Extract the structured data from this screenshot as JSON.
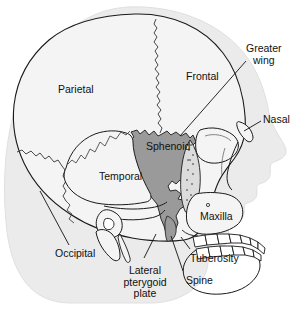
{
  "figure": {
    "width": 306,
    "height": 313
  },
  "colors": {
    "background": "#ffffff",
    "head_silhouette": "#ebebeb",
    "skull_fill": "#f4f4f4",
    "sphenoid_fill": "#9a9a9a",
    "outline": "#1a1a1a",
    "suture": "#333333",
    "leader_line": "#111111",
    "text": "#111111"
  },
  "labels": [
    {
      "id": "parietal",
      "text": "Parietal",
      "x": 58,
      "y": 84,
      "leader": false
    },
    {
      "id": "frontal",
      "text": "Frontal",
      "x": 186,
      "y": 71,
      "leader": false
    },
    {
      "id": "greater-wing",
      "text": "Greater\nwing",
      "x": 246,
      "y": 43,
      "leader": true
    },
    {
      "id": "nasal",
      "text": "Nasal",
      "x": 263,
      "y": 114,
      "leader": true
    },
    {
      "id": "sphenoid",
      "text": "Sphenoid",
      "x": 146,
      "y": 141,
      "leader": false
    },
    {
      "id": "temporal",
      "text": "Temporal",
      "x": 99,
      "y": 171,
      "leader": false
    },
    {
      "id": "maxilla",
      "text": "Maxilla",
      "x": 200,
      "y": 211,
      "leader": false
    },
    {
      "id": "occipital",
      "text": "Occipital",
      "x": 55,
      "y": 248,
      "leader": true
    },
    {
      "id": "tuberosity",
      "text": "Tuberosity",
      "x": 190,
      "y": 253,
      "leader": true
    },
    {
      "id": "lateral-pterygoid-plate",
      "text": "Lateral\npterygoid\nplate",
      "x": 113,
      "y": 265,
      "leader": true
    },
    {
      "id": "spine",
      "text": "Spine",
      "x": 186,
      "y": 275,
      "leader": true
    }
  ],
  "leader_lines": [
    {
      "id": "greater-wing-leader",
      "from": [
        246,
        61
      ],
      "to": [
        180,
        136
      ]
    },
    {
      "id": "nasal-leader",
      "from": [
        261,
        121
      ],
      "to": [
        243,
        131
      ]
    },
    {
      "id": "occipital-leader",
      "from": [
        69,
        245
      ],
      "to": [
        40,
        191
      ]
    },
    {
      "id": "lateral-pterygoid-leader",
      "from": [
        144,
        259
      ],
      "to": [
        155,
        236
      ]
    },
    {
      "id": "spine-leader",
      "from": [
        184,
        272
      ],
      "to": [
        172,
        235
      ]
    },
    {
      "id": "tuberosity-leader",
      "from": [
        190,
        249
      ],
      "to": [
        182,
        236
      ]
    }
  ],
  "anatomy_parts": [
    {
      "id": "head-silhouette",
      "name": "head-soft-tissue-profile"
    },
    {
      "id": "cranial-vault",
      "name": "cranial-vault-outline"
    },
    {
      "id": "sphenoid-bone",
      "name": "sphenoid-bone-shaded"
    },
    {
      "id": "coronal-suture",
      "name": "coronal-suture"
    },
    {
      "id": "lambdoid-suture",
      "name": "lambdoid-suture"
    },
    {
      "id": "temporal-bone",
      "name": "temporal-bone"
    },
    {
      "id": "zygomatic-arch",
      "name": "zygomatic-arch"
    },
    {
      "id": "orbit",
      "name": "orbit"
    },
    {
      "id": "nasal-bone",
      "name": "nasal-bone"
    },
    {
      "id": "maxilla-bone",
      "name": "maxilla"
    },
    {
      "id": "mandible",
      "name": "mandible"
    },
    {
      "id": "upper-teeth",
      "name": "upper-teeth-row"
    },
    {
      "id": "lower-teeth",
      "name": "lower-teeth-row"
    },
    {
      "id": "external-acoustic-meatus",
      "name": "external-acoustic-meatus"
    },
    {
      "id": "mastoid-process",
      "name": "mastoid-process"
    },
    {
      "id": "styloid-process",
      "name": "styloid-process"
    },
    {
      "id": "pterygoid-plate",
      "name": "lateral-pterygoid-plate"
    }
  ]
}
